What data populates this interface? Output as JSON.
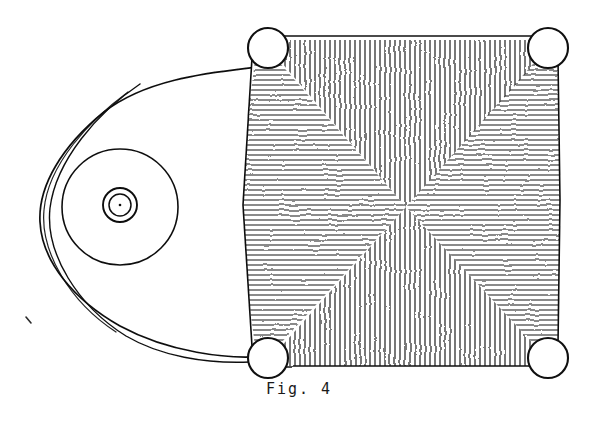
{
  "figure": {
    "caption": "Fig. 4",
    "background_color": "#ffffff",
    "ink_color": "#101010",
    "width": 598,
    "height": 423
  },
  "chart_data": {
    "type": "diagram",
    "title": "Fig. 4",
    "parts": [
      {
        "name": "left-lobe-outline",
        "shape": "oval",
        "center": [
          145,
          205
        ],
        "radius_x": 122,
        "radius_y": 152,
        "stroke": "#101010",
        "stroke_width": 1.6,
        "fill": "none"
      },
      {
        "name": "left-lobe-inner-outline",
        "shape": "oval-arc",
        "note": "second line running parallel just inside the left edge of the lobe",
        "stroke": "#101010",
        "stroke_width": 1.4
      },
      {
        "name": "large-concentric-circle",
        "shape": "circle",
        "center": [
          120,
          207
        ],
        "radius": 58,
        "stroke": "#101010",
        "stroke_width": 1.5,
        "fill": "none"
      },
      {
        "name": "middle-concentric-circle",
        "shape": "circle",
        "center": [
          120,
          205
        ],
        "radius": 17,
        "stroke": "#101010",
        "stroke_width": 1.6,
        "fill": "none"
      },
      {
        "name": "inner-concentric-circle",
        "shape": "circle",
        "center": [
          120,
          205
        ],
        "radius": 11,
        "stroke": "#101010",
        "stroke_width": 1.4,
        "fill": "none"
      },
      {
        "name": "center-dot",
        "shape": "dot",
        "center": [
          120,
          205
        ],
        "radius": 1.2,
        "fill": "#101010"
      },
      {
        "name": "hatched-field",
        "shape": "squircle",
        "bounds": [
          243,
          38,
          560,
          363
        ],
        "sectors": 4,
        "hatch_spacing_px": 5,
        "stroke": "#101010",
        "stroke_width": 1.1
      },
      {
        "name": "corner-circle-top-left",
        "shape": "circle",
        "center": [
          268,
          48
        ],
        "radius": 20,
        "fill": "#ffffff",
        "stroke": "#101010",
        "stroke_width": 2
      },
      {
        "name": "corner-circle-top-right",
        "shape": "circle",
        "center": [
          548,
          48
        ],
        "radius": 20,
        "fill": "#ffffff",
        "stroke": "#101010",
        "stroke_width": 2
      },
      {
        "name": "corner-circle-bottom-left",
        "shape": "circle",
        "center": [
          268,
          358
        ],
        "radius": 20,
        "fill": "#ffffff",
        "stroke": "#101010",
        "stroke_width": 2
      },
      {
        "name": "corner-circle-bottom-right",
        "shape": "circle",
        "center": [
          548,
          358
        ],
        "radius": 20,
        "fill": "#ffffff",
        "stroke": "#101010",
        "stroke_width": 2
      },
      {
        "name": "stray-ink-speck",
        "shape": "tick",
        "position": [
          28,
          320
        ]
      }
    ],
    "hatch_sectors": [
      {
        "name": "top-sector",
        "direction": "vertical"
      },
      {
        "name": "bottom-sector",
        "direction": "vertical"
      },
      {
        "name": "left-sector",
        "direction": "horizontal"
      },
      {
        "name": "right-sector",
        "direction": "horizontal"
      }
    ],
    "convergence_point": [
      406,
      207
    ]
  }
}
